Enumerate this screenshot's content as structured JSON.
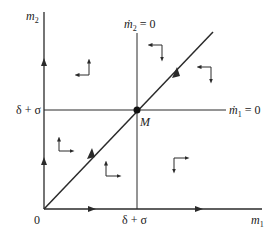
{
  "diagram": {
    "axes": {
      "x_label": "m",
      "x_sub": "1",
      "y_label": "m",
      "y_sub": "2",
      "origin_label": "0"
    },
    "threshold_x_label": "δ + σ",
    "threshold_y_label": "δ + σ",
    "nullcline_m2": {
      "label": "ṁ",
      "sub": "2",
      "eq": " = 0"
    },
    "nullcline_m1": {
      "label": "ṁ",
      "sub": "1",
      "eq": " = 0"
    },
    "equilibrium_label": "M",
    "regions": [
      {
        "name": "upper-left",
        "horizontal": "left",
        "vertical": "up"
      },
      {
        "name": "upper-middle",
        "horizontal": "left",
        "vertical": "down"
      },
      {
        "name": "upper-right",
        "horizontal": "left",
        "vertical": "down"
      },
      {
        "name": "lower-left",
        "horizontal": "right",
        "vertical": "up"
      },
      {
        "name": "lower-middle",
        "horizontal": "right",
        "vertical": "up"
      },
      {
        "name": "lower-right",
        "horizontal": "right",
        "vertical": "down"
      }
    ],
    "colors": {
      "ink": "#2a2a2a",
      "background": "#ffffff"
    }
  }
}
